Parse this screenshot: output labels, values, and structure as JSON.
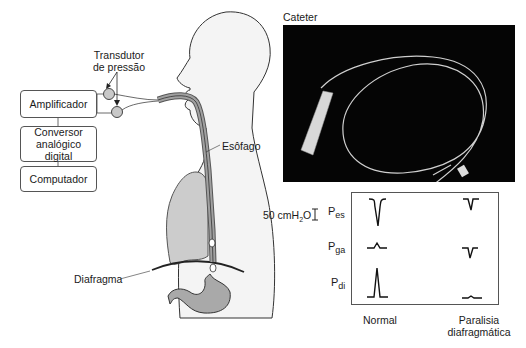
{
  "diagram": {
    "blocks": [
      {
        "id": "amplifier",
        "label": "Amplificador"
      },
      {
        "id": "converter",
        "label": "Conversor analógico digital",
        "lines": [
          "Conversor",
          "analógico digital"
        ]
      },
      {
        "id": "computer",
        "label": "Computador"
      }
    ],
    "labels": {
      "transducer_line1": "Transdutor",
      "transducer_line2": "de pressão",
      "esophagus": "Esôfago",
      "diaphragm": "Diafragma",
      "catheter": "Cateter"
    },
    "scale_bar": {
      "label": "50 cmH",
      "sub": "2",
      "suffix": "O"
    },
    "traces": {
      "rows": [
        {
          "id": "pes",
          "label": "P",
          "sub": "es"
        },
        {
          "id": "pga",
          "label": "P",
          "sub": "ga"
        },
        {
          "id": "pdi",
          "label": "P",
          "sub": "di"
        }
      ],
      "columns": [
        {
          "id": "normal",
          "label": "Normal"
        },
        {
          "id": "paralysis",
          "label_line1": "Paralisia",
          "label_line2": "diafragmática"
        }
      ]
    },
    "colors": {
      "body_fill": "#f2f2f2",
      "organ_fill": "#c8c8c8",
      "stomach_fill": "#a9a9a9",
      "outline": "#333333",
      "photo_bg": "#050505"
    }
  }
}
